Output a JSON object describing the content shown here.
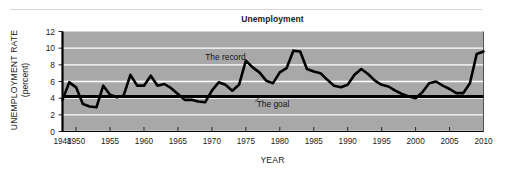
{
  "figure": {
    "title": "Unemployment",
    "xlabel": "YEAR",
    "ylabel_line1": "UNEMPLOYMENT RATE",
    "ylabel_line2": "(percent)",
    "annotation_record": "The record",
    "annotation_goal": "The goal",
    "colors": {
      "plot_background": "#a8a8a8",
      "gridline": "#ffffff",
      "line": "#000000",
      "axis": "#000000",
      "text": "#1a1a1a",
      "top_rule": "#d6d6d6",
      "page_background": "#ffffff"
    }
  },
  "chart_data": {
    "type": "line",
    "title": "Unemployment",
    "xlabel": "YEAR",
    "ylabel": "UNEMPLOYMENT RATE (percent)",
    "xlim": [
      1948,
      2010
    ],
    "ylim": [
      0,
      12
    ],
    "ytick_labels": [
      "0",
      "2",
      "4",
      "6",
      "8",
      "10",
      "12"
    ],
    "yticks": [
      0,
      2,
      4,
      6,
      8,
      10,
      12
    ],
    "xtick_labels": [
      "1948",
      "1950",
      "1955",
      "1960",
      "1965",
      "1970",
      "1975",
      "1980",
      "1985",
      "1990",
      "1995",
      "2000",
      "2005",
      "2010"
    ],
    "xticks": [
      1948,
      1950,
      1955,
      1960,
      1965,
      1970,
      1975,
      1980,
      1985,
      1990,
      1995,
      2000,
      2005,
      2010
    ],
    "grid": true,
    "grid_axis": "y",
    "legend": "none",
    "annotations": [
      {
        "text": "The record",
        "x": 1972,
        "y": 8.6,
        "points_to_series": "The record"
      },
      {
        "text": "The goal",
        "x": 1979,
        "y": 2.9,
        "points_to_series": "The goal",
        "leader_to": {
          "x": 1977.2,
          "y": 4.25
        }
      }
    ],
    "series": [
      {
        "name": "The record",
        "x": [
          1948,
          1949,
          1950,
          1951,
          1952,
          1953,
          1954,
          1955,
          1956,
          1957,
          1958,
          1959,
          1960,
          1961,
          1962,
          1963,
          1964,
          1965,
          1966,
          1967,
          1968,
          1969,
          1970,
          1971,
          1972,
          1973,
          1974,
          1975,
          1976,
          1977,
          1978,
          1979,
          1980,
          1981,
          1982,
          1983,
          1984,
          1985,
          1986,
          1987,
          1988,
          1989,
          1990,
          1991,
          1992,
          1993,
          1994,
          1995,
          1996,
          1997,
          1998,
          1999,
          2000,
          2001,
          2002,
          2003,
          2004,
          2005,
          2006,
          2007,
          2008,
          2009,
          2010
        ],
        "values": [
          3.8,
          5.9,
          5.3,
          3.3,
          3.0,
          2.9,
          5.5,
          4.4,
          4.1,
          4.3,
          6.8,
          5.5,
          5.5,
          6.7,
          5.5,
          5.7,
          5.2,
          4.5,
          3.8,
          3.8,
          3.6,
          3.5,
          4.9,
          5.9,
          5.6,
          4.9,
          5.6,
          8.5,
          7.7,
          7.1,
          6.1,
          5.8,
          7.1,
          7.6,
          9.7,
          9.6,
          7.5,
          7.2,
          7.0,
          6.2,
          5.5,
          5.3,
          5.6,
          6.8,
          7.5,
          6.9,
          6.1,
          5.6,
          5.4,
          4.9,
          4.5,
          4.2,
          4.0,
          4.7,
          5.8,
          6.0,
          5.5,
          5.1,
          4.6,
          4.6,
          5.8,
          9.3,
          9.6
        ],
        "style": "thick-black-line"
      },
      {
        "name": "The goal",
        "x": [
          1948,
          2010
        ],
        "values": [
          4.2,
          4.2
        ],
        "style": "thick-black-horizontal-line"
      }
    ]
  }
}
